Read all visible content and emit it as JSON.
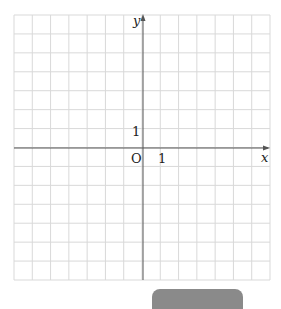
{
  "diagram": {
    "type": "coordinate-plane",
    "grid": {
      "columns": 14,
      "rows": 14,
      "cells_left_of_y_axis": 7,
      "cells_above_x_axis": 7,
      "line_color": "#d9d9d9",
      "axis_color": "#555555"
    },
    "labels": {
      "x_axis": "x",
      "y_axis": "y",
      "origin": "O",
      "x_unit": "1",
      "y_unit": "1"
    }
  },
  "bottom_button": {
    "color": "#8a8a8a"
  }
}
